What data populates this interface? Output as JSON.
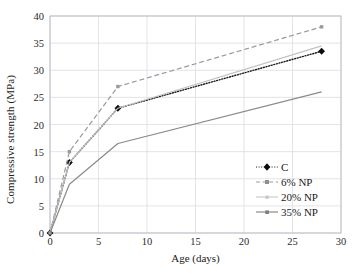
{
  "chart_data": {
    "type": "line",
    "title": "",
    "xlabel": "Age (days)",
    "ylabel": "Compressive strength (MPa)",
    "xlim": [
      0,
      30
    ],
    "ylim": [
      0,
      40
    ],
    "xticks": [
      0,
      5,
      10,
      15,
      20,
      25,
      30
    ],
    "yticks": [
      0,
      5,
      10,
      15,
      20,
      25,
      30,
      35,
      40
    ],
    "grid": true,
    "legend_position": "lower right inside axes",
    "x": [
      0,
      2,
      7,
      28
    ],
    "series": [
      {
        "name": "C",
        "values": [
          0,
          13,
          23,
          33.5
        ],
        "color": "#1a1a1a",
        "linestyle": "dotted",
        "marker": "diamond"
      },
      {
        "name": "6% NP",
        "values": [
          0,
          15,
          27,
          38
        ],
        "color": "#9a9a9a",
        "linestyle": "dashed",
        "marker": "square"
      },
      {
        "name": "20% NP",
        "values": [
          0,
          13,
          23,
          34.5
        ],
        "color": "#c2c2c2",
        "linestyle": "solid",
        "marker": "none"
      },
      {
        "name": "35% NP",
        "values": [
          0,
          9,
          16.5,
          26
        ],
        "color": "#8a8a8a",
        "linestyle": "solid",
        "marker": "none"
      }
    ]
  },
  "legend": {
    "items": [
      {
        "label": "C"
      },
      {
        "label": "6% NP"
      },
      {
        "label": "20% NP"
      },
      {
        "label": "35% NP"
      }
    ]
  },
  "axes": {
    "x_tick_labels": [
      "0",
      "5",
      "10",
      "15",
      "20",
      "25",
      "30"
    ],
    "y_tick_labels": [
      "0",
      "5",
      "10",
      "15",
      "20",
      "25",
      "30",
      "35",
      "40"
    ]
  },
  "colors": {
    "grid": "#dcdce4",
    "frame": "#b9b9c4",
    "text": "#1a1a1a"
  }
}
